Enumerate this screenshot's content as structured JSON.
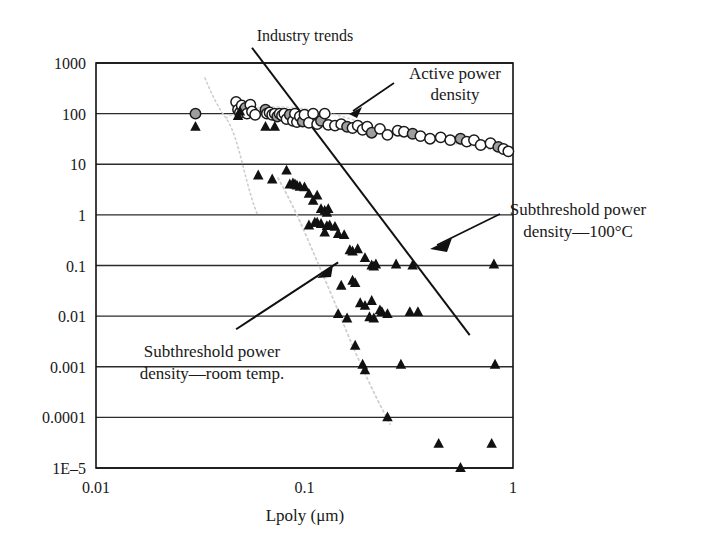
{
  "chart_data": {
    "type": "scatter",
    "title": "Industry trends",
    "xlabel": "Lpoly (μm)",
    "ylabel": "",
    "xscale": "log",
    "yscale": "log",
    "xlim": [
      0.01,
      1
    ],
    "ylim": [
      1e-05,
      1000
    ],
    "grid": true,
    "legend_position": "none",
    "xticks": [
      "0.01",
      "0.1",
      "1"
    ],
    "xtick_values": [
      0.01,
      0.1,
      1
    ],
    "yticks": [
      "1000",
      "100",
      "10",
      "1",
      "0.1",
      "0.01",
      "0.001",
      "0.0001",
      "1E–5"
    ],
    "ytick_values": [
      1000,
      100,
      10,
      1,
      0.1,
      0.01,
      0.001,
      0.0001,
      1e-05
    ],
    "series": [
      {
        "name": "Active power density",
        "marker": "circle",
        "marker_fill": "open-and-gray",
        "color": "#9a9a9a",
        "points": [
          [
            0.03,
            100
          ],
          [
            0.047,
            170
          ],
          [
            0.048,
            120
          ],
          [
            0.049,
            105
          ],
          [
            0.05,
            145
          ],
          [
            0.052,
            130
          ],
          [
            0.053,
            100
          ],
          [
            0.055,
            150
          ],
          [
            0.056,
            110
          ],
          [
            0.058,
            95
          ],
          [
            0.065,
            120
          ],
          [
            0.066,
            100
          ],
          [
            0.068,
            105
          ],
          [
            0.07,
            95
          ],
          [
            0.072,
            100
          ],
          [
            0.074,
            88
          ],
          [
            0.076,
            100
          ],
          [
            0.078,
            92
          ],
          [
            0.08,
            100
          ],
          [
            0.082,
            78
          ],
          [
            0.085,
            95
          ],
          [
            0.088,
            72
          ],
          [
            0.09,
            100
          ],
          [
            0.092,
            68
          ],
          [
            0.095,
            88
          ],
          [
            0.098,
            70
          ],
          [
            0.1,
            95
          ],
          [
            0.105,
            66
          ],
          [
            0.11,
            100
          ],
          [
            0.115,
            62
          ],
          [
            0.12,
            72
          ],
          [
            0.125,
            100
          ],
          [
            0.13,
            60
          ],
          [
            0.14,
            58
          ],
          [
            0.15,
            62
          ],
          [
            0.16,
            55
          ],
          [
            0.17,
            52
          ],
          [
            0.18,
            58
          ],
          [
            0.19,
            48
          ],
          [
            0.2,
            55
          ],
          [
            0.21,
            42
          ],
          [
            0.23,
            50
          ],
          [
            0.25,
            38
          ],
          [
            0.28,
            46
          ],
          [
            0.3,
            44
          ],
          [
            0.33,
            40
          ],
          [
            0.36,
            36
          ],
          [
            0.4,
            32
          ],
          [
            0.45,
            34
          ],
          [
            0.5,
            30
          ],
          [
            0.56,
            32
          ],
          [
            0.6,
            28
          ],
          [
            0.65,
            30
          ],
          [
            0.7,
            24
          ],
          [
            0.78,
            26
          ],
          [
            0.85,
            22
          ],
          [
            0.9,
            20
          ],
          [
            0.95,
            18
          ]
        ]
      },
      {
        "name": "Subthreshold power density",
        "marker": "triangle",
        "marker_fill": "solid",
        "color": "#111111",
        "points": [
          [
            0.03,
            55
          ],
          [
            0.048,
            90
          ],
          [
            0.049,
            110
          ],
          [
            0.065,
            55
          ],
          [
            0.072,
            55
          ],
          [
            0.06,
            6.0
          ],
          [
            0.07,
            5.0
          ],
          [
            0.082,
            7.5
          ],
          [
            0.085,
            4.0
          ],
          [
            0.088,
            4.2
          ],
          [
            0.09,
            4.0
          ],
          [
            0.092,
            3.8
          ],
          [
            0.095,
            3.6
          ],
          [
            0.1,
            3.5
          ],
          [
            0.105,
            2.6
          ],
          [
            0.11,
            1.9
          ],
          [
            0.115,
            2.4
          ],
          [
            0.12,
            1.3
          ],
          [
            0.125,
            1.2
          ],
          [
            0.128,
            1.1
          ],
          [
            0.13,
            1.3
          ],
          [
            0.105,
            0.62
          ],
          [
            0.112,
            0.7
          ],
          [
            0.115,
            0.7
          ],
          [
            0.12,
            0.66
          ],
          [
            0.125,
            0.45
          ],
          [
            0.128,
            0.6
          ],
          [
            0.132,
            0.62
          ],
          [
            0.14,
            0.58
          ],
          [
            0.145,
            0.42
          ],
          [
            0.155,
            0.4
          ],
          [
            0.165,
            0.2
          ],
          [
            0.17,
            0.19
          ],
          [
            0.18,
            0.21
          ],
          [
            0.195,
            0.14
          ],
          [
            0.21,
            0.1
          ],
          [
            0.215,
            0.095
          ],
          [
            0.22,
            0.105
          ],
          [
            0.15,
            0.04
          ],
          [
            0.17,
            0.05
          ],
          [
            0.175,
            0.045
          ],
          [
            0.185,
            0.018
          ],
          [
            0.195,
            0.016
          ],
          [
            0.21,
            0.02
          ],
          [
            0.23,
            0.013
          ],
          [
            0.235,
            0.012
          ],
          [
            0.145,
            0.011
          ],
          [
            0.16,
            0.009
          ],
          [
            0.205,
            0.0095
          ],
          [
            0.215,
            0.009
          ],
          [
            0.175,
            0.0026
          ],
          [
            0.19,
            0.0011
          ],
          [
            0.195,
            0.00085
          ],
          [
            0.29,
            0.0011
          ],
          [
            0.33,
            0.1
          ],
          [
            0.32,
            0.012
          ],
          [
            0.35,
            0.012
          ],
          [
            0.25,
            0.0001
          ],
          [
            0.44,
            3e-05
          ],
          [
            0.56,
            1e-05
          ],
          [
            0.25,
            0.011
          ],
          [
            0.275,
            0.105
          ],
          [
            0.81,
            0.105
          ],
          [
            0.82,
            0.0011
          ],
          [
            0.79,
            3e-05
          ]
        ]
      }
    ],
    "trendlines": [
      {
        "name": "active-power-trend",
        "style": "solid",
        "from": [
          0.056,
          2000
        ],
        "to": [
          0.62,
          0.0042
        ]
      },
      {
        "name": "subthreshold-room-temp-trend",
        "style": "solid",
        "from": [
          0.047,
          0.0055
        ],
        "to": [
          0.145,
          0.115
        ]
      }
    ],
    "guide_curves": [
      {
        "name": "active-power-guide",
        "style": "dotted",
        "color": "#c9c9c9"
      },
      {
        "name": "subthreshold-guide",
        "style": "dotted",
        "color": "#c9c9c9"
      }
    ],
    "annotations": [
      {
        "name": "active-power-density",
        "text_line1": "Active power",
        "text_line2": "density",
        "arrow_from": [
          0.36,
          640
        ],
        "arrow_to": [
          0.105,
          125
        ]
      },
      {
        "name": "subthreshold-power-density-100c",
        "text_line1": "Subthreshold power",
        "text_line2": "density—100°C",
        "arrow_from": [
          0.64,
          2.2
        ],
        "arrow_to": [
          0.27,
          0.3
        ]
      },
      {
        "name": "subthreshold-power-density-room-temp",
        "text_line1": "Subthreshold power",
        "text_line2": "density—room temp."
      }
    ]
  }
}
